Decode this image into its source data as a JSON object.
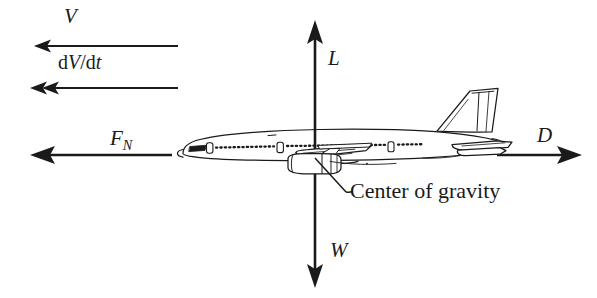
{
  "figure": {
    "background_color": "#ffffff",
    "ink_color": "#1a1a1a"
  },
  "labels": {
    "velocity": "V",
    "acceleration_d": "d",
    "acceleration_V": "V",
    "acceleration_slash": "/d",
    "acceleration_t": "t",
    "net_force": "F",
    "net_force_sub": "N",
    "lift": "L",
    "weight": "W",
    "drag": "D",
    "center_of_gravity": "Center of gravity"
  },
  "vectors": [
    {
      "name": "velocity",
      "symbol": "V",
      "direction": "left",
      "arrowheads": 1
    },
    {
      "name": "acceleration",
      "symbol": "dV/dt",
      "direction": "left",
      "arrowheads": 2
    },
    {
      "name": "net-force",
      "symbol": "F_N",
      "direction": "left",
      "arrowheads": 1
    },
    {
      "name": "lift",
      "symbol": "L",
      "direction": "up",
      "arrowheads": 1
    },
    {
      "name": "weight",
      "symbol": "W",
      "direction": "down",
      "arrowheads": 1
    },
    {
      "name": "drag",
      "symbol": "D",
      "direction": "right",
      "arrowheads": 1
    }
  ],
  "annotation": {
    "text": "Center of gravity",
    "points_to": "center-of-gravity-point"
  }
}
